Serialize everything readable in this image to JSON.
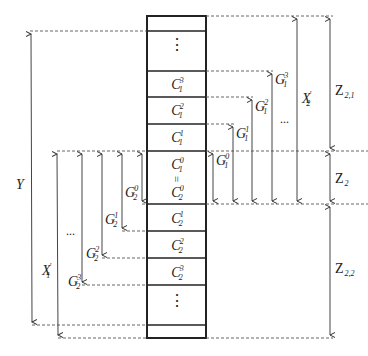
{
  "diagram": {
    "type": "memory-layout-with-dimension-arrows",
    "colors": {
      "line": "#222222",
      "dashed": "#444444",
      "background": "#ffffff"
    },
    "column_cells": [
      {
        "id": "top-empty",
        "label": ""
      },
      {
        "id": "top-ellipsis",
        "label": "⋮"
      },
      {
        "id": "c1-3",
        "base": "C",
        "sup": "3",
        "sub": "1"
      },
      {
        "id": "c1-2",
        "base": "C",
        "sup": "2",
        "sub": "1"
      },
      {
        "id": "c1-1",
        "base": "C",
        "sup": "1",
        "sub": "1"
      },
      {
        "id": "c-center",
        "top": {
          "base": "C",
          "sup": "0",
          "sub": "1"
        },
        "equals": "=",
        "bottom": {
          "base": "C",
          "sup": "0",
          "sub": "2"
        }
      },
      {
        "id": "c2-1",
        "base": "C",
        "sup": "1",
        "sub": "2"
      },
      {
        "id": "c2-2",
        "base": "C",
        "sup": "2",
        "sub": "2"
      },
      {
        "id": "c2-3",
        "base": "C",
        "sup": "3",
        "sub": "2"
      },
      {
        "id": "bottom-ellipsis",
        "label": "⋮"
      },
      {
        "id": "bottom-empty",
        "label": ""
      }
    ],
    "right_arrows": {
      "g1": [
        {
          "base": "G",
          "sup": "0",
          "sub": "1"
        },
        {
          "base": "G",
          "sup": "1",
          "sub": "1"
        },
        {
          "base": "G",
          "sup": "2",
          "sub": "1"
        },
        {
          "base": "G",
          "sup": "3",
          "sub": "1"
        }
      ],
      "ellipsis": "...",
      "x2": {
        "base": "X",
        "sup": "'",
        "sub": "2"
      },
      "z21": {
        "base": "Z",
        "sub": "2,1"
      },
      "z2": {
        "base": "Z",
        "sub": "2"
      },
      "z22": {
        "base": "Z",
        "sub": "2,2"
      }
    },
    "left_arrows": {
      "g2": [
        {
          "base": "G",
          "sup": "0",
          "sub": "2"
        },
        {
          "base": "G",
          "sup": "1",
          "sub": "2"
        },
        {
          "base": "G",
          "sup": "2",
          "sub": "2"
        },
        {
          "base": "G",
          "sup": "3",
          "sub": "2"
        }
      ],
      "ellipsis": "...",
      "x1": {
        "base": "X",
        "sup": "'",
        "sub": "1"
      },
      "y": {
        "base": "Y"
      }
    }
  }
}
